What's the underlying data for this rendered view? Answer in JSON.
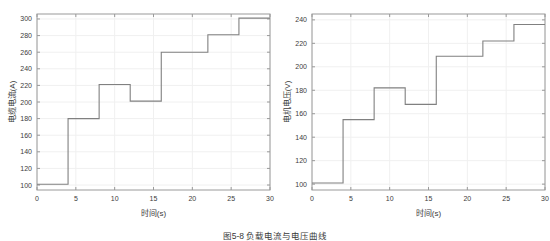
{
  "figure": {
    "caption": "图5-8 负载电流与电压曲线"
  },
  "chart_data": [
    {
      "type": "line",
      "id": "cable-current",
      "title": "",
      "xlabel": "时间(s)",
      "ylabel": "电缆电流(A)",
      "xlim": [
        0,
        30
      ],
      "ylim": [
        94,
        306
      ],
      "xticks": [
        0,
        5,
        10,
        15,
        20,
        25,
        30
      ],
      "xtick_labels": [
        "0",
        "5",
        "10",
        "15",
        "20",
        "25",
        "30"
      ],
      "yticks": [
        100,
        120,
        140,
        160,
        180,
        200,
        220,
        240,
        260,
        280,
        300
      ],
      "ytick_labels": [
        "100",
        "120",
        "140",
        "160",
        "180",
        "200",
        "220",
        "240",
        "260",
        "280",
        "300"
      ],
      "grid": true,
      "legend": "none",
      "drawstyle": "steps-post",
      "line_color": "#808080",
      "x": [
        0,
        4,
        8,
        12,
        16,
        22,
        26,
        30
      ],
      "values": [
        101,
        180,
        221,
        201,
        260,
        281,
        301,
        301
      ],
      "steps": [
        {
          "x_start": 0,
          "x_end": 4,
          "y": 101
        },
        {
          "x_start": 4,
          "x_end": 8,
          "y": 180
        },
        {
          "x_start": 8,
          "x_end": 12,
          "y": 221
        },
        {
          "x_start": 12,
          "x_end": 16,
          "y": 201
        },
        {
          "x_start": 16,
          "x_end": 22,
          "y": 260
        },
        {
          "x_start": 22,
          "x_end": 26,
          "y": 281
        },
        {
          "x_start": 26,
          "x_end": 30,
          "y": 301
        }
      ]
    },
    {
      "type": "line",
      "id": "motor-voltage",
      "title": "",
      "xlabel": "时间(s)",
      "ylabel": "电机电压(V)",
      "xlim": [
        0,
        30
      ],
      "ylim": [
        95,
        245
      ],
      "xticks": [
        0,
        5,
        10,
        15,
        20,
        25,
        30
      ],
      "xtick_labels": [
        "0",
        "5",
        "10",
        "15",
        "20",
        "25",
        "30"
      ],
      "yticks": [
        100,
        120,
        140,
        160,
        180,
        200,
        220,
        240
      ],
      "ytick_labels": [
        "100",
        "120",
        "140",
        "160",
        "180",
        "200",
        "220",
        "240"
      ],
      "grid": true,
      "legend": "none",
      "drawstyle": "steps-post",
      "line_color": "#808080",
      "x": [
        0,
        4,
        8,
        12,
        16,
        22,
        26,
        30
      ],
      "values": [
        101,
        155,
        182,
        168,
        209,
        222,
        236,
        236
      ],
      "steps": [
        {
          "x_start": 0,
          "x_end": 4,
          "y": 101
        },
        {
          "x_start": 4,
          "x_end": 8,
          "y": 155
        },
        {
          "x_start": 8,
          "x_end": 12,
          "y": 182
        },
        {
          "x_start": 12,
          "x_end": 16,
          "y": 168
        },
        {
          "x_start": 16,
          "x_end": 22,
          "y": 209
        },
        {
          "x_start": 22,
          "x_end": 26,
          "y": 222
        },
        {
          "x_start": 26,
          "x_end": 30,
          "y": 236
        }
      ]
    }
  ],
  "colors": {
    "line": "#808080",
    "grid": "#f0f0f0",
    "axis": "#9a9a9a",
    "text": "#3c3c3c",
    "background": "#ffffff"
  }
}
